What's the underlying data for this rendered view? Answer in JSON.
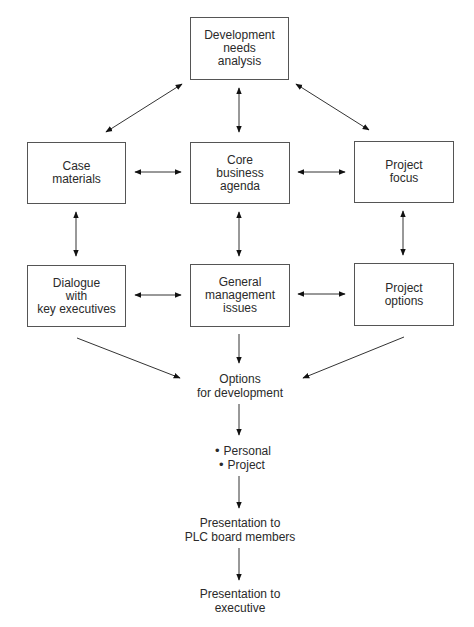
{
  "diagram": {
    "nodes": {
      "development_needs": {
        "lines": [
          "Development",
          "needs",
          "analysis"
        ]
      },
      "case_materials": {
        "lines": [
          "Case",
          "materials"
        ]
      },
      "core_business": {
        "lines": [
          "Core",
          "business",
          "agenda"
        ]
      },
      "project_focus": {
        "lines": [
          "Project",
          "focus"
        ]
      },
      "dialogue": {
        "lines": [
          "Dialogue",
          "with",
          "key executives"
        ]
      },
      "general_mgmt": {
        "lines": [
          "General",
          "management",
          "issues"
        ]
      },
      "project_options": {
        "lines": [
          "Project",
          "options"
        ]
      },
      "options_dev": {
        "lines": [
          "Options",
          "for development"
        ]
      },
      "bullets": [
        "Personal",
        "Project"
      ],
      "presentation_plc": {
        "lines": [
          "Presentation to",
          "PLC board members"
        ]
      },
      "presentation_exec": {
        "lines": [
          "Presentation to",
          "executive"
        ]
      }
    },
    "edges": [
      {
        "from": "development_needs",
        "to": "case_materials",
        "type": "bidirectional"
      },
      {
        "from": "development_needs",
        "to": "core_business",
        "type": "bidirectional"
      },
      {
        "from": "development_needs",
        "to": "project_focus",
        "type": "bidirectional"
      },
      {
        "from": "case_materials",
        "to": "core_business",
        "type": "bidirectional"
      },
      {
        "from": "core_business",
        "to": "project_focus",
        "type": "bidirectional"
      },
      {
        "from": "case_materials",
        "to": "dialogue",
        "type": "bidirectional"
      },
      {
        "from": "core_business",
        "to": "general_mgmt",
        "type": "bidirectional"
      },
      {
        "from": "project_focus",
        "to": "project_options",
        "type": "bidirectional"
      },
      {
        "from": "dialogue",
        "to": "general_mgmt",
        "type": "bidirectional"
      },
      {
        "from": "general_mgmt",
        "to": "project_options",
        "type": "bidirectional"
      },
      {
        "from": "dialogue",
        "to": "options_dev",
        "type": "directed"
      },
      {
        "from": "general_mgmt",
        "to": "options_dev",
        "type": "directed"
      },
      {
        "from": "project_options",
        "to": "options_dev",
        "type": "directed"
      },
      {
        "from": "options_dev",
        "to": "bullets",
        "type": "directed"
      },
      {
        "from": "bullets",
        "to": "presentation_plc",
        "type": "directed"
      },
      {
        "from": "presentation_plc",
        "to": "presentation_exec",
        "type": "directed"
      }
    ]
  }
}
